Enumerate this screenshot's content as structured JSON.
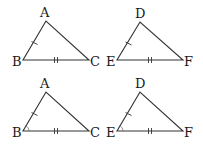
{
  "figures": [
    {
      "id": "top-left",
      "labels": {
        "top": "A",
        "left": "B",
        "right": "C"
      },
      "vertices": {
        "top": [
          46,
          21
        ],
        "left": [
          23,
          60
        ],
        "right": [
          89,
          60
        ]
      },
      "marks": {
        "left_side": 1,
        "base": 2,
        "angle_left": false
      }
    },
    {
      "id": "top-right",
      "labels": {
        "top": "D",
        "left": "E",
        "right": "F"
      },
      "vertices": {
        "top": [
          140,
          22
        ],
        "left": [
          117,
          60
        ],
        "right": [
          183,
          60
        ]
      },
      "marks": {
        "left_side": 1,
        "base": 2,
        "angle_left": false
      }
    },
    {
      "id": "bottom-left",
      "labels": {
        "top": "A",
        "left": "B",
        "right": "C"
      },
      "vertices": {
        "top": [
          46,
          92
        ],
        "left": [
          23,
          131
        ],
        "right": [
          89,
          131
        ]
      },
      "marks": {
        "left_side": 1,
        "base": 2,
        "angle_left": true
      }
    },
    {
      "id": "bottom-right",
      "labels": {
        "top": "D",
        "left": "E",
        "right": "F"
      },
      "vertices": {
        "top": [
          140,
          92
        ],
        "left": [
          117,
          131
        ],
        "right": [
          183,
          131
        ]
      },
      "marks": {
        "left_side": 1,
        "base": 2,
        "angle_left": true
      }
    }
  ]
}
